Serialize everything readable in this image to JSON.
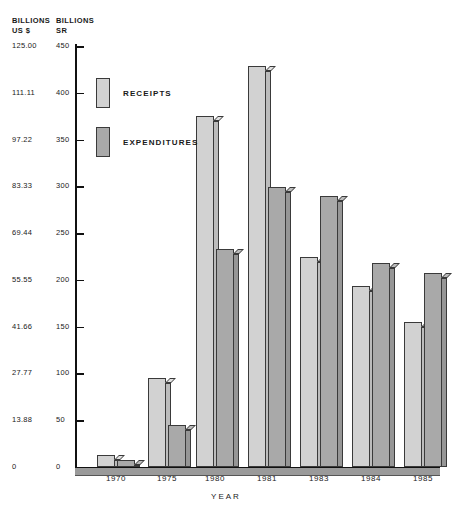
{
  "chart_data": {
    "type": "bar",
    "title": "",
    "xlabel": "YEAR",
    "categories": [
      "1970",
      "1975",
      "1980",
      "1981",
      "1983",
      "1984",
      "1985"
    ],
    "series": [
      {
        "name": "RECEIPTS",
        "values": [
          13,
          95,
          375,
          429,
          224,
          194,
          155
        ]
      },
      {
        "name": "EXPENDITURES",
        "values": [
          8,
          45,
          233,
          299,
          290,
          218,
          207
        ]
      }
    ],
    "ylabel_left": "BILLIONS\nUS $",
    "ylabel_right": "BILLIONS\nSR",
    "ylim": [
      0,
      450
    ],
    "yticks_sr": [
      "450",
      "400",
      "350",
      "300",
      "250",
      "200",
      "150",
      "100",
      "50",
      "0"
    ],
    "yticks_usd": [
      "125.00",
      "111.11",
      "97.22",
      "83.33",
      "69.44",
      "55.55",
      "41.66",
      "27.77",
      "13.88",
      "0"
    ],
    "grid": false,
    "legend_position": "upper-left-inside",
    "colors": {
      "receipts": "#d2d2d2",
      "expenditures": "#a9a9a9",
      "outline": "#3a3a3a",
      "axis": "#111111"
    }
  },
  "axis": {
    "head_usd": "BILLIONS\nUS $",
    "head_sr": "BILLIONS\nSR",
    "x_title": "YEAR"
  }
}
